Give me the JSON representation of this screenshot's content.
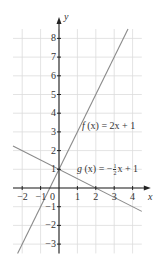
{
  "chart_data": {
    "type": "line",
    "title": "",
    "xlabel": "x",
    "ylabel": "y",
    "xlim": [
      -2.5,
      4.5
    ],
    "ylim": [
      -3.5,
      8.5
    ],
    "grid": true,
    "x_ticks": [
      -2,
      -1,
      0,
      1,
      2,
      3,
      4
    ],
    "x_tick_labels": [
      "−2",
      "−1",
      "0",
      "1",
      "2",
      "3",
      "4"
    ],
    "y_ticks": [
      -3,
      -2,
      -1,
      1,
      2,
      3,
      4,
      5,
      6,
      7,
      8
    ],
    "y_tick_labels": [
      "−3",
      "−2",
      "−1",
      "1",
      "2",
      "3",
      "4",
      "5",
      "6",
      "7",
      "8"
    ],
    "origin_label": "0",
    "series": [
      {
        "name": "f(x) = 2x + 1",
        "label_text": "f (x) = 2x + 1",
        "slope": 2,
        "intercept": 1,
        "x": [
          -2.25,
          3.75
        ],
        "y": [
          -3.5,
          8.5
        ],
        "color": "#8a8a8a"
      },
      {
        "name": "g(x) = −½x + 1",
        "label_text": "g (x) = −½x + 1",
        "slope": -0.5,
        "intercept": 1,
        "x": [
          -2.5,
          4.5
        ],
        "y": [
          2.25,
          -1.25
        ],
        "color": "#8a8a8a"
      }
    ],
    "intersection": {
      "x": 0,
      "y": 1
    }
  },
  "labels": {
    "x_axis": "x",
    "y_axis": "y",
    "f_name": "f",
    "f_arg": "(x)",
    "f_rhs": "= 2x + 1",
    "g_name": "g",
    "g_arg": "(x)",
    "g_rhs_prefix": "= −",
    "g_frac_num": "1",
    "g_frac_den": "2",
    "g_rhs_suffix": "x + 1"
  },
  "colors": {
    "axis": "#222222",
    "grid": "#dcdcdc",
    "line": "#8a8a8a",
    "text": "#333333"
  }
}
